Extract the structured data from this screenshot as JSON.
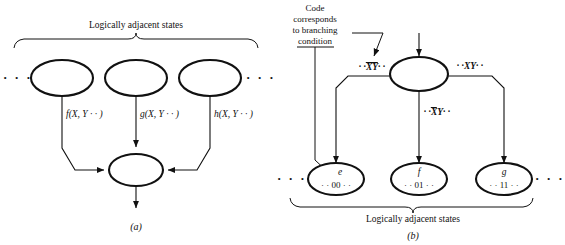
{
  "figure": {
    "panels": [
      {
        "id": "a",
        "caption": "(a)",
        "brace_label": "Logically adjacent states",
        "left_ellipsis": "· · ·",
        "right_ellipsis": "· · ·",
        "states": [
          {
            "name": "state-left",
            "label": ""
          },
          {
            "name": "state-middle",
            "label": ""
          },
          {
            "name": "state-right",
            "label": ""
          }
        ],
        "merge_state": {
          "name": "merge-state",
          "label": ""
        },
        "edge_labels": [
          "f(X, Y · · )",
          "g(X, Y · · )",
          "h(X, Y · · )"
        ]
      },
      {
        "id": "b",
        "caption": "(b)",
        "brace_label": "Logically adjacent states",
        "annotation": [
          "Code",
          "corresponds",
          "to branching",
          "condition"
        ],
        "left_ellipsis": "· · ·",
        "right_ellipsis": "· · ·",
        "source_state": {
          "name": "branch-state",
          "label": ""
        },
        "branch_labels": {
          "left": {
            "prefix": "· ·",
            "bar": "XY",
            "bar_span": "both",
            "suffix": "· ·"
          },
          "middle": {
            "prefix": "· ·",
            "bar": "X",
            "plain": "Y",
            "bar_span": "x",
            "suffix": "· ·"
          },
          "right": {
            "prefix": "· ·",
            "bar": "",
            "plain": "XY",
            "bar_span": "none",
            "suffix": "· ·"
          }
        },
        "target_states": [
          {
            "name": "state-e",
            "label": "e",
            "code": "· · 00 · ·"
          },
          {
            "name": "state-f",
            "label": "f",
            "code": "· · 01 · ·"
          },
          {
            "name": "state-g",
            "label": "g",
            "code": "· · 11 · ·"
          }
        ]
      }
    ],
    "colors": {
      "stroke": "#111111",
      "background": "#ffffff",
      "thick_stroke": "#000000"
    }
  }
}
